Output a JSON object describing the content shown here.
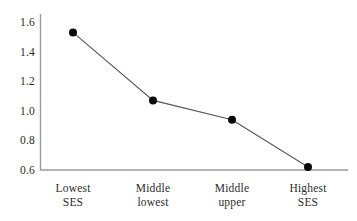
{
  "chart_data": {
    "type": "line",
    "title": "",
    "xlabel": "",
    "ylabel": "",
    "categories": [
      "Lowest SES",
      "Middle lowest",
      "Middle upper",
      "Highest SES"
    ],
    "category_lines": [
      [
        "Lowest",
        "SES"
      ],
      [
        "Middle",
        "lowest"
      ],
      [
        "Middle",
        "upper"
      ],
      [
        "Highest",
        "SES"
      ]
    ],
    "values": [
      1.53,
      1.07,
      0.94,
      0.62
    ],
    "ylim": [
      0.6,
      1.6
    ],
    "yticks": [
      "1.6",
      "1.4",
      "1.2",
      "1.0",
      "0.8",
      "0.6"
    ],
    "ytick_values": [
      1.6,
      1.4,
      1.2,
      1.0,
      0.8,
      0.6
    ],
    "grid": false,
    "legend": null,
    "series": [
      {
        "name": "",
        "values": [
          1.53,
          1.07,
          0.94,
          0.62
        ],
        "marker": "filled-circle",
        "marker_color": "#000000",
        "line_color": "#555555"
      }
    ]
  },
  "axes": {
    "y_axis_color": "#9a9a9a",
    "x_axis_color": "#9a9a9a",
    "background": "#ffffff"
  }
}
